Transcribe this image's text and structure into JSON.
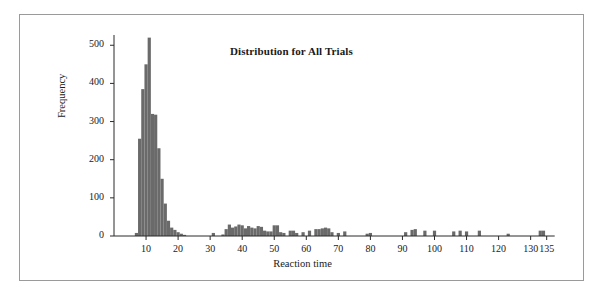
{
  "figure": {
    "title": "Distribution for All Trials",
    "frame_color": "#9a9a9a",
    "background": "#ffffff"
  },
  "chart_data": {
    "type": "bar",
    "subtype": "histogram",
    "title": "Distribution for All Trials",
    "xlabel": "Reaction time",
    "ylabel": "Frequency",
    "xlim": [
      0,
      140
    ],
    "ylim": [
      0,
      540
    ],
    "grid": false,
    "legend": null,
    "bar_color": "#6a6a6a",
    "bin_width": 1,
    "axis_color": "#2a2a2a",
    "xticks": [
      10,
      20,
      30,
      40,
      50,
      60,
      70,
      80,
      90,
      100,
      110,
      120,
      130,
      135
    ],
    "xtick_labels": [
      "10",
      "20",
      "30",
      "40",
      "50",
      "60",
      "70",
      "80",
      "90",
      "100",
      "110",
      "120",
      "130",
      "135"
    ],
    "yticks": [
      0,
      100,
      200,
      300,
      400,
      500
    ],
    "ytick_labels": [
      "0",
      "100",
      "200",
      "300",
      "400",
      "500"
    ],
    "x": [
      7,
      8,
      9,
      10,
      11,
      12,
      13,
      14,
      15,
      16,
      17,
      18,
      19,
      20,
      21,
      22,
      31,
      34,
      35,
      36,
      37,
      38,
      39,
      40,
      41,
      42,
      43,
      44,
      45,
      46,
      47,
      48,
      49,
      50,
      51,
      52,
      53,
      55,
      56,
      57,
      59,
      61,
      63,
      64,
      65,
      66,
      67,
      68,
      70,
      72,
      79,
      80,
      91,
      93,
      94,
      97,
      100,
      106,
      108,
      110,
      114,
      123,
      133,
      134
    ],
    "values": [
      8,
      255,
      385,
      450,
      520,
      320,
      318,
      230,
      150,
      85,
      40,
      22,
      16,
      10,
      6,
      3,
      8,
      4,
      18,
      30,
      22,
      25,
      30,
      28,
      20,
      26,
      22,
      20,
      26,
      24,
      14,
      12,
      12,
      28,
      28,
      10,
      8,
      14,
      14,
      8,
      10,
      14,
      18,
      18,
      20,
      22,
      20,
      10,
      8,
      12,
      6,
      8,
      10,
      16,
      18,
      14,
      14,
      12,
      14,
      12,
      14,
      6,
      14,
      14
    ]
  },
  "axes": {
    "x_title": "Reaction time",
    "y_title": "Frequency"
  }
}
